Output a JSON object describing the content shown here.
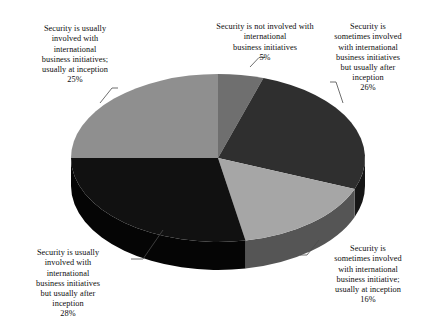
{
  "chart_data": {
    "type": "pie",
    "title": "",
    "subtitle": "",
    "xlabel": "",
    "ylabel": "",
    "legend_position": "none",
    "grid": false,
    "three_d": true,
    "unit": "%",
    "categories": [
      "Security is not involved with international business initiatives",
      "Security is sometimes involved with international business initiatives but usually after inception",
      "Security is sometimes involved with international business initiative; usually at inception",
      "Security is usually involved with international business initiatives but usually after inception",
      "Security is usually involved with international business initiatives; usually at inception"
    ],
    "values": [
      5,
      26,
      16,
      28,
      25
    ],
    "slices": [
      {
        "key": "not-involved",
        "label": "Security is not involved with\ninternational\nbusiness initiatives",
        "label_flat": "Security is not involved with international business initiatives",
        "value": 5,
        "percent_text": "5%",
        "color": "#6f6f6f",
        "side_color": "#3a3a3a",
        "start_deg": 0,
        "end_deg": 18
      },
      {
        "key": "sometimes-after-inception",
        "label": "Security is\nsometimes involved\nwith international\nbusiness initiatives\nbut usually after\ninception",
        "label_flat": "Security is sometimes involved with international business initiatives but usually after inception",
        "value": 26,
        "percent_text": "26%",
        "color": "#2f2f2f",
        "side_color": "#161616",
        "start_deg": 18,
        "end_deg": 111.6
      },
      {
        "key": "sometimes-at-inception",
        "label": "Security is\nsometimes involved\nwith international\nbusiness initiative;\nusually at inception",
        "label_flat": "Security is sometimes involved with international business initiative; usually at inception",
        "value": 16,
        "percent_text": "16%",
        "color": "#a6a6a6",
        "side_color": "#555555",
        "start_deg": 111.6,
        "end_deg": 169.2
      },
      {
        "key": "usually-after-inception",
        "label": "Security is usually\ninvolved with\ninternational\nbusiness initiatives\nbut usually after\ninception",
        "label_flat": "Security is usually involved with international business initiatives but usually after inception",
        "value": 28,
        "percent_text": "28%",
        "color": "#111111",
        "side_color": "#050505",
        "start_deg": 169.2,
        "end_deg": 270
      },
      {
        "key": "usually-at-inception",
        "label": "Security is usually\ninvolved with\ninternational\nbusiness initiatives;\nusually at inception",
        "label_flat": "Security is usually involved with international business initiatives; usually at inception",
        "value": 25,
        "percent_text": "25%",
        "color": "#8f8f8f",
        "side_color": "#4a4a4a",
        "start_deg": 270,
        "end_deg": 360
      }
    ],
    "geometry": {
      "cx": 218,
      "cy": 158,
      "rx": 147,
      "ry": 84,
      "depth": 28
    },
    "colors": {
      "background": "#ffffff",
      "text": "#0d0d0d",
      "leader_line": "#4a4a4a"
    }
  }
}
